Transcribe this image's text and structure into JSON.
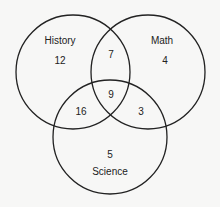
{
  "diagram": {
    "type": "venn-3",
    "sets": [
      {
        "name": "History",
        "only": "12"
      },
      {
        "name": "Math",
        "only": "4"
      },
      {
        "name": "Science",
        "only": "5"
      }
    ],
    "regions": {
      "history_only": "12",
      "math_only": "4",
      "science_only": "5",
      "history_math": "7",
      "history_science": "16",
      "math_science": "3",
      "all_three": "9"
    },
    "labels": {
      "history": "History",
      "math": "Math",
      "science": "Science"
    }
  }
}
